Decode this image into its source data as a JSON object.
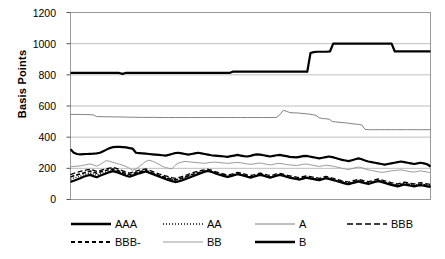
{
  "chart_data": {
    "type": "line",
    "title": "",
    "xlabel": "",
    "ylabel": "Basis Points",
    "ylim": [
      0,
      1200
    ],
    "yticks": [
      0,
      200,
      400,
      600,
      800,
      1000,
      1200
    ],
    "ytick_labels": [
      "0",
      "200",
      "400",
      "600",
      "800",
      "1000",
      "1200"
    ],
    "xlim": [
      0,
      100
    ],
    "xticks": [],
    "xtick_labels": [],
    "grid": "horizontal",
    "legend_position": "bottom",
    "series": [
      {
        "name": "AAA",
        "style": "solid",
        "width": 2.2,
        "color": "#000000",
        "values": [
          113,
          120,
          128,
          137,
          146,
          152,
          158,
          150,
          143,
          152,
          160,
          168,
          176,
          182,
          176,
          168,
          160,
          152,
          146,
          152,
          160,
          168,
          174,
          180,
          172,
          164,
          156,
          148,
          140,
          132,
          124,
          118,
          112,
          116,
          122,
          130,
          138,
          146,
          154,
          162,
          170,
          178,
          184,
          178,
          170,
          162,
          156,
          150,
          144,
          150,
          156,
          162,
          158,
          152,
          146,
          140,
          146,
          152,
          158,
          152,
          146,
          140,
          146,
          152,
          158,
          152,
          146,
          140,
          136,
          132,
          128,
          134,
          140,
          136,
          132,
          128,
          124,
          130,
          136,
          132,
          126,
          120,
          114,
          108,
          102,
          98,
          104,
          110,
          116,
          110,
          104,
          100,
          106,
          112,
          118,
          112,
          106,
          100,
          94,
          88,
          84,
          90,
          96,
          92,
          88,
          84,
          88,
          92,
          88,
          84,
          80
        ]
      },
      {
        "name": "AA",
        "style": "dotted",
        "width": 1.3,
        "color": "#000000",
        "values": [
          130,
          138,
          144,
          150,
          158,
          164,
          170,
          164,
          156,
          164,
          170,
          176,
          182,
          188,
          182,
          174,
          166,
          160,
          154,
          160,
          166,
          172,
          178,
          184,
          176,
          168,
          160,
          152,
          146,
          140,
          134,
          128,
          124,
          128,
          134,
          142,
          150,
          158,
          164,
          170,
          176,
          182,
          186,
          180,
          172,
          166,
          160,
          154,
          148,
          154,
          160,
          166,
          162,
          156,
          150,
          146,
          150,
          156,
          162,
          156,
          150,
          146,
          150,
          156,
          160,
          154,
          148,
          144,
          140,
          136,
          132,
          138,
          144,
          140,
          136,
          132,
          128,
          134,
          140,
          136,
          130,
          124,
          118,
          112,
          108,
          104,
          110,
          116,
          122,
          116,
          110,
          106,
          112,
          118,
          124,
          118,
          112,
          106,
          100,
          96,
          92,
          98,
          104,
          100,
          96,
          92,
          96,
          100,
          96,
          92,
          88
        ]
      },
      {
        "name": "A",
        "style": "solid",
        "width": 1.0,
        "color": "#808080",
        "values": [
          546,
          546,
          546,
          546,
          545,
          545,
          544,
          543,
          532,
          532,
          531,
          531,
          531,
          530,
          530,
          530,
          529,
          529,
          528,
          528,
          528,
          527,
          527,
          527,
          527,
          527,
          527,
          526,
          526,
          526,
          526,
          526,
          526,
          526,
          526,
          526,
          526,
          526,
          526,
          526,
          526,
          526,
          526,
          526,
          526,
          526,
          526,
          526,
          526,
          526,
          526,
          526,
          526,
          526,
          526,
          526,
          526,
          526,
          526,
          526,
          526,
          526,
          526,
          527,
          544,
          572,
          566,
          558,
          556,
          556,
          554,
          552,
          550,
          548,
          544,
          540,
          524,
          520,
          518,
          516,
          500,
          498,
          496,
          494,
          492,
          490,
          486,
          484,
          482,
          478,
          450,
          448,
          448,
          448,
          448,
          448,
          448,
          448,
          448,
          448,
          448,
          448,
          448,
          448,
          448,
          448,
          448,
          448,
          448,
          448,
          448
        ]
      },
      {
        "name": "BBB",
        "style": "dashed",
        "width": 1.3,
        "color": "#000000",
        "values": [
          160,
          168,
          174,
          180,
          186,
          190,
          194,
          188,
          180,
          186,
          192,
          198,
          202,
          206,
          200,
          192,
          184,
          176,
          170,
          176,
          182,
          188,
          192,
          196,
          188,
          180,
          172,
          164,
          158,
          152,
          146,
          140,
          136,
          140,
          146,
          154,
          162,
          170,
          176,
          182,
          186,
          190,
          194,
          188,
          180,
          174,
          168,
          162,
          156,
          162,
          168,
          174,
          170,
          164,
          158,
          154,
          158,
          164,
          170,
          164,
          158,
          154,
          158,
          164,
          168,
          162,
          156,
          152,
          148,
          144,
          140,
          146,
          152,
          148,
          144,
          140,
          136,
          142,
          148,
          144,
          138,
          132,
          126,
          120,
          116,
          112,
          118,
          124,
          130,
          124,
          118,
          114,
          120,
          126,
          132,
          126,
          120,
          114,
          108,
          104,
          100,
          106,
          112,
          108,
          104,
          100,
          104,
          108,
          104,
          100,
          96
        ]
      },
      {
        "name": "BBB-",
        "style": "dashdot",
        "width": 1.6,
        "color": "#000000",
        "values": [
          145,
          152,
          158,
          164,
          170,
          176,
          182,
          176,
          168,
          176,
          182,
          188,
          192,
          196,
          190,
          182,
          174,
          166,
          160,
          166,
          172,
          178,
          182,
          186,
          178,
          170,
          162,
          154,
          148,
          142,
          136,
          130,
          126,
          130,
          136,
          144,
          152,
          160,
          166,
          172,
          176,
          180,
          184,
          178,
          170,
          164,
          158,
          152,
          146,
          152,
          158,
          164,
          160,
          154,
          148,
          144,
          148,
          154,
          160,
          154,
          148,
          144,
          148,
          154,
          158,
          152,
          146,
          142,
          138,
          134,
          130,
          136,
          142,
          138,
          134,
          130,
          126,
          132,
          138,
          134,
          128,
          122,
          116,
          110,
          106,
          102,
          108,
          114,
          120,
          114,
          108,
          104,
          110,
          116,
          122,
          116,
          110,
          104,
          98,
          94,
          90,
          96,
          102,
          98,
          94,
          90,
          94,
          98,
          94,
          90,
          86
        ]
      },
      {
        "name": "BB",
        "style": "solid",
        "width": 1.0,
        "color": "#9a9a9a",
        "values": [
          210,
          212,
          214,
          216,
          220,
          224,
          228,
          222,
          214,
          224,
          238,
          250,
          244,
          238,
          232,
          226,
          220,
          212,
          200,
          188,
          196,
          212,
          228,
          244,
          252,
          246,
          238,
          226,
          214,
          206,
          200,
          196,
          220,
          234,
          240,
          244,
          242,
          240,
          238,
          236,
          234,
          232,
          236,
          238,
          240,
          238,
          236,
          234,
          232,
          234,
          236,
          238,
          236,
          232,
          228,
          226,
          228,
          232,
          234,
          230,
          226,
          222,
          226,
          230,
          232,
          228,
          224,
          222,
          220,
          218,
          222,
          226,
          228,
          224,
          220,
          216,
          212,
          216,
          220,
          218,
          214,
          210,
          206,
          200,
          196,
          192,
          198,
          204,
          208,
          204,
          196,
          190,
          186,
          182,
          178,
          174,
          176,
          180,
          184,
          186,
          188,
          190,
          186,
          182,
          178,
          176,
          180,
          184,
          180,
          176,
          172
        ]
      },
      {
        "name": "B",
        "style": "solid",
        "width": 2.2,
        "color": "#000000",
        "values": [
          812,
          812,
          812,
          812,
          812,
          812,
          812,
          812,
          812,
          812,
          812,
          812,
          812,
          812,
          812,
          812,
          806,
          812,
          812,
          812,
          812,
          812,
          812,
          812,
          812,
          812,
          812,
          812,
          812,
          812,
          812,
          812,
          812,
          812,
          812,
          812,
          812,
          812,
          812,
          812,
          812,
          812,
          812,
          812,
          812,
          812,
          812,
          812,
          812,
          812,
          820,
          820,
          820,
          820,
          820,
          820,
          820,
          820,
          820,
          820,
          820,
          820,
          820,
          820,
          820,
          820,
          820,
          820,
          820,
          820,
          820,
          820,
          820,
          820,
          940,
          946,
          948,
          948,
          948,
          948,
          950,
          1000,
          1000,
          1000,
          1000,
          1000,
          1000,
          1000,
          1000,
          1000,
          1000,
          1000,
          1000,
          1000,
          1000,
          1000,
          1000,
          1000,
          1000,
          1000,
          950,
          950,
          950,
          950,
          950,
          950,
          950,
          950,
          950,
          950,
          950,
          950
        ]
      }
    ],
    "upper_cluster": {
      "name": "AAA-upper",
      "values": [
        322,
        300,
        292,
        290,
        291,
        292,
        293,
        294,
        296,
        300,
        310,
        320,
        330,
        336,
        338,
        338,
        336,
        334,
        330,
        326,
        300,
        298,
        296,
        294,
        292,
        290,
        288,
        286,
        284,
        282,
        286,
        292,
        298,
        300,
        296,
        292,
        288,
        292,
        296,
        300,
        296,
        292,
        288,
        284,
        282,
        280,
        278,
        276,
        274,
        278,
        282,
        286,
        282,
        278,
        276,
        280,
        286,
        290,
        288,
        284,
        280,
        276,
        280,
        284,
        286,
        282,
        278,
        274,
        272,
        270,
        274,
        278,
        280,
        276,
        272,
        268,
        264,
        268,
        272,
        276,
        272,
        266,
        260,
        254,
        250,
        246,
        252,
        258,
        264,
        258,
        250,
        244,
        240,
        236,
        232,
        228,
        224,
        228,
        232,
        236,
        240,
        244,
        240,
        236,
        232,
        228,
        232,
        236,
        232,
        226,
        212
      ]
    }
  },
  "legend": {
    "rows": [
      [
        {
          "label": "AAA",
          "style": "solid-thick",
          "color": "#000000"
        },
        {
          "label": "AA",
          "style": "dotted",
          "color": "#000000"
        },
        {
          "label": "A",
          "style": "solid-thin-gray",
          "color": "#808080"
        },
        {
          "label": "BBB",
          "style": "dashed",
          "color": "#000000"
        }
      ],
      [
        {
          "label": "BBB-",
          "style": "dashdot",
          "color": "#000000"
        },
        {
          "label": "BB",
          "style": "solid-thin-gray2",
          "color": "#9a9a9a"
        },
        {
          "label": "B",
          "style": "solid-thick2",
          "color": "#000000"
        }
      ]
    ]
  },
  "axis": {
    "y_title": "Basis Points",
    "tick_1200": "1200",
    "tick_1000": "1000",
    "tick_800": "800",
    "tick_600": "600",
    "tick_400": "400",
    "tick_200": "200",
    "tick_0": "0"
  },
  "colors": {
    "plot_border": "#808080",
    "gridline": "#bfbfbf",
    "text": "#000000"
  }
}
